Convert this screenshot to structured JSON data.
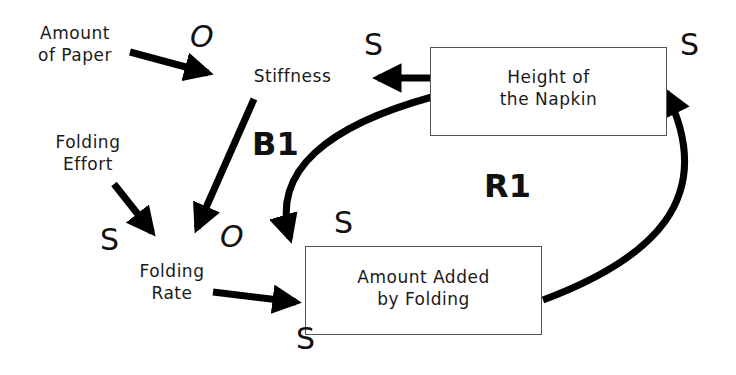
{
  "diagram": {
    "type": "causal-loop",
    "nodes": {
      "amount_of_paper": "Amount\nof Paper",
      "amount_of_paper_l1": "Amount",
      "amount_of_paper_l2": "of Paper",
      "stiffness": "Stiffness",
      "height_l1": "Height of",
      "height_l2": "the Napkin",
      "folding_effort_l1": "Folding",
      "folding_effort_l2": "Effort",
      "folding_rate_l1": "Folding",
      "folding_rate_l2": "Rate",
      "added_l1": "Amount Added",
      "added_l2": "by Folding"
    },
    "polarities": {
      "paper_to_stiffness": "O",
      "height_to_stiffness": "S",
      "added_to_height": "S",
      "height_to_added": "S",
      "effort_to_rate": "S",
      "stiffness_to_rate": "O",
      "rate_to_added": "S"
    },
    "loops": {
      "balancing": "B1",
      "reinforcing": "R1"
    },
    "colors": {
      "ink": "#000000",
      "box_border": "#555555",
      "background": "#ffffff"
    }
  }
}
